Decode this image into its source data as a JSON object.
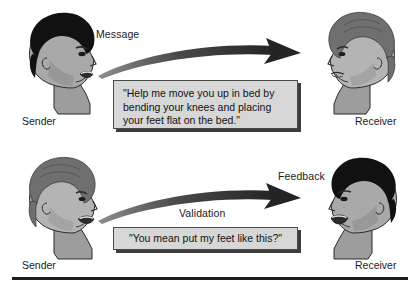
{
  "figure": {
    "colors": {
      "ink": "#1b1b1b",
      "box_fill": "#d7d7d7",
      "box_border": "#4a4a4a",
      "box_shadow": "#3d3d3d",
      "arrow": "#2b2b2b",
      "hair_dark": "#111111",
      "hair_gray": "#6f6f6f",
      "skin": "#a9a9a9",
      "skin_shadow": "#8e8e8e",
      "outline": "#2a2a2a",
      "rule": "#1f1f1f"
    },
    "rows": [
      {
        "id": "message-row",
        "arrow_label": "Message",
        "secondary_label": "",
        "quote": "\"Help me move you up in bed by\nbending your knees and placing\nyour feet flat on the bed.\"",
        "left_role": "Sender",
        "right_role": "Receiver",
        "left_head": {
          "facing": "right",
          "hair": "dark",
          "mouth": "open"
        },
        "right_head": {
          "facing": "left",
          "hair": "gray",
          "mouth": "closed"
        },
        "arrow_direction": "left-to-right"
      },
      {
        "id": "feedback-row",
        "arrow_label": "Feedback",
        "secondary_label": "Validation",
        "quote": "\"You mean put my feet like this?\"",
        "left_role": "Sender",
        "right_role": "Receiver",
        "left_head": {
          "facing": "right",
          "hair": "gray",
          "mouth": "open"
        },
        "right_head": {
          "facing": "left",
          "hair": "dark",
          "mouth": "open"
        },
        "arrow_direction": "left-to-right"
      }
    ]
  }
}
